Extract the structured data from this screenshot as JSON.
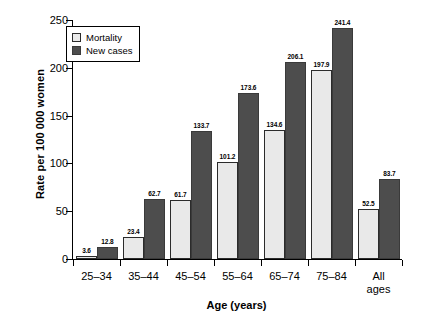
{
  "chart_data": {
    "type": "bar",
    "title": "",
    "xlabel": "Age (years)",
    "ylabel": "Rate per 100 000 women",
    "categories": [
      "25–34",
      "35–44",
      "45–54",
      "55–64",
      "65–74",
      "75–84",
      "All\nages"
    ],
    "category_labels": [
      {
        "line1": "25–34",
        "line2": ""
      },
      {
        "line1": "35–44",
        "line2": ""
      },
      {
        "line1": "45–54",
        "line2": ""
      },
      {
        "line1": "55–64",
        "line2": ""
      },
      {
        "line1": "65–74",
        "line2": ""
      },
      {
        "line1": "75–84",
        "line2": ""
      },
      {
        "line1": "All",
        "line2": "ages"
      }
    ],
    "series": [
      {
        "name": "Mortality",
        "color": "#e9e9e9",
        "values": [
          3.6,
          23.4,
          61.7,
          101.2,
          134.6,
          197.9,
          52.5
        ],
        "labels": [
          "3.6",
          "23.4",
          "61.7",
          "101.2",
          "134.6",
          "197.9",
          "52.5"
        ]
      },
      {
        "name": "New cases",
        "color": "#4d4d4d",
        "values": [
          12.8,
          62.7,
          133.7,
          173.6,
          206.1,
          241.4,
          83.7
        ],
        "labels": [
          "12.8",
          "62.7",
          "133.7",
          "173.6",
          "206.1",
          "241.4",
          "83.7"
        ]
      }
    ],
    "ylim": [
      0,
      250
    ],
    "yticks": [
      0,
      50,
      100,
      150,
      200,
      250
    ],
    "ytick_labels": [
      "0",
      "50",
      "100",
      "150",
      "200",
      "250"
    ],
    "grid": false,
    "legend_position": "top-left",
    "legend_entries": [
      "Mortality",
      "New cases"
    ]
  }
}
